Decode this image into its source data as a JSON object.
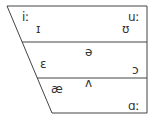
{
  "diagram": {
    "type": "vowel-chart",
    "colors": {
      "line": "#444444",
      "text": "#333333",
      "background": "#ffffff"
    },
    "vowels": [
      {
        "symbol": "iː",
        "name": "vowel-i-long",
        "x": 22,
        "y": 21
      },
      {
        "symbol": "ɪ",
        "name": "vowel-small-capital-i",
        "x": 36,
        "y": 33
      },
      {
        "symbol": "uː",
        "name": "vowel-u-long",
        "x": 128,
        "y": 21
      },
      {
        "symbol": "ʊ",
        "name": "vowel-upsilon",
        "x": 122,
        "y": 33
      },
      {
        "symbol": "ə",
        "name": "vowel-schwa",
        "x": 85,
        "y": 56
      },
      {
        "symbol": "ɛ",
        "name": "vowel-open-e",
        "x": 40,
        "y": 68
      },
      {
        "symbol": "ɔ",
        "name": "vowel-open-o",
        "x": 132,
        "y": 74
      },
      {
        "symbol": "ʌ",
        "name": "vowel-turned-v",
        "x": 85,
        "y": 87
      },
      {
        "symbol": "æ",
        "name": "vowel-ash",
        "x": 51,
        "y": 93
      },
      {
        "symbol": "ɑː",
        "name": "vowel-alpha-long",
        "x": 128,
        "y": 110
      }
    ]
  }
}
